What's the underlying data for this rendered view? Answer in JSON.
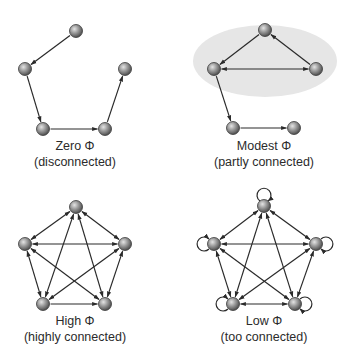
{
  "colors": {
    "edge": "#2a2a2a",
    "node_light": "#d8d8d8",
    "node_mid": "#8e8e8e",
    "node_dark": "#4a4a4a",
    "node_stroke": "#3a3a3a",
    "highlight": "#e6e6e6"
  },
  "panels": [
    {
      "id": "zero",
      "title": "Zero Φ",
      "subtitle": "(disconnected)",
      "label_x": 75,
      "title_y": 139,
      "subtitle_y": 155,
      "nodes": [
        [
          76,
          31
        ],
        [
          25,
          69
        ],
        [
          125,
          69
        ],
        [
          43,
          129
        ],
        [
          105,
          129
        ]
      ],
      "edges": [
        [
          0,
          1,
          "one"
        ],
        [
          1,
          3,
          "one"
        ],
        [
          3,
          4,
          "one"
        ],
        [
          4,
          2,
          "one"
        ]
      ],
      "loops": false,
      "highlight": null
    },
    {
      "id": "modest",
      "title": "Modest Φ",
      "subtitle": "(partly connected)",
      "label_x": 264,
      "title_y": 139,
      "subtitle_y": 155,
      "nodes": [
        [
          265,
          30
        ],
        [
          214,
          69
        ],
        [
          316,
          69
        ],
        [
          233,
          128
        ],
        [
          294,
          128
        ]
      ],
      "edges": [
        [
          0,
          1,
          "one"
        ],
        [
          2,
          0,
          "one"
        ],
        [
          1,
          2,
          "both"
        ],
        [
          1,
          3,
          "one"
        ],
        [
          3,
          4,
          "one"
        ]
      ],
      "loops": false,
      "highlight": {
        "cx": 265,
        "cy": 61,
        "rx": 72,
        "ry": 36
      }
    },
    {
      "id": "high",
      "title": "High Φ",
      "subtitle": "(highly connected)",
      "label_x": 75,
      "title_y": 314,
      "subtitle_y": 330,
      "nodes": [
        [
          76,
          207
        ],
        [
          25,
          244
        ],
        [
          125,
          244
        ],
        [
          43,
          304
        ],
        [
          105,
          304
        ]
      ],
      "edges": [
        [
          0,
          1,
          "both"
        ],
        [
          0,
          2,
          "both"
        ],
        [
          1,
          2,
          "both"
        ],
        [
          1,
          3,
          "both"
        ],
        [
          2,
          4,
          "both"
        ],
        [
          0,
          3,
          "both"
        ],
        [
          0,
          4,
          "both"
        ],
        [
          1,
          4,
          "both"
        ],
        [
          2,
          3,
          "both"
        ],
        [
          3,
          4,
          "one"
        ]
      ],
      "loops": false,
      "highlight": null
    },
    {
      "id": "low",
      "title": "Low Φ",
      "subtitle": "(too connected)",
      "label_x": 264,
      "title_y": 314,
      "subtitle_y": 330,
      "nodes": [
        [
          264,
          206
        ],
        [
          214,
          244
        ],
        [
          316,
          244
        ],
        [
          233,
          304
        ],
        [
          295,
          304
        ]
      ],
      "edges": [
        [
          0,
          1,
          "both"
        ],
        [
          0,
          2,
          "both"
        ],
        [
          1,
          2,
          "both"
        ],
        [
          1,
          3,
          "both"
        ],
        [
          2,
          4,
          "both"
        ],
        [
          0,
          3,
          "both"
        ],
        [
          0,
          4,
          "both"
        ],
        [
          1,
          4,
          "both"
        ],
        [
          2,
          3,
          "both"
        ],
        [
          3,
          4,
          "both"
        ]
      ],
      "loops": true,
      "loop_dirs": [
        "up",
        "left",
        "right",
        "left",
        "right"
      ],
      "highlight": null
    }
  ]
}
